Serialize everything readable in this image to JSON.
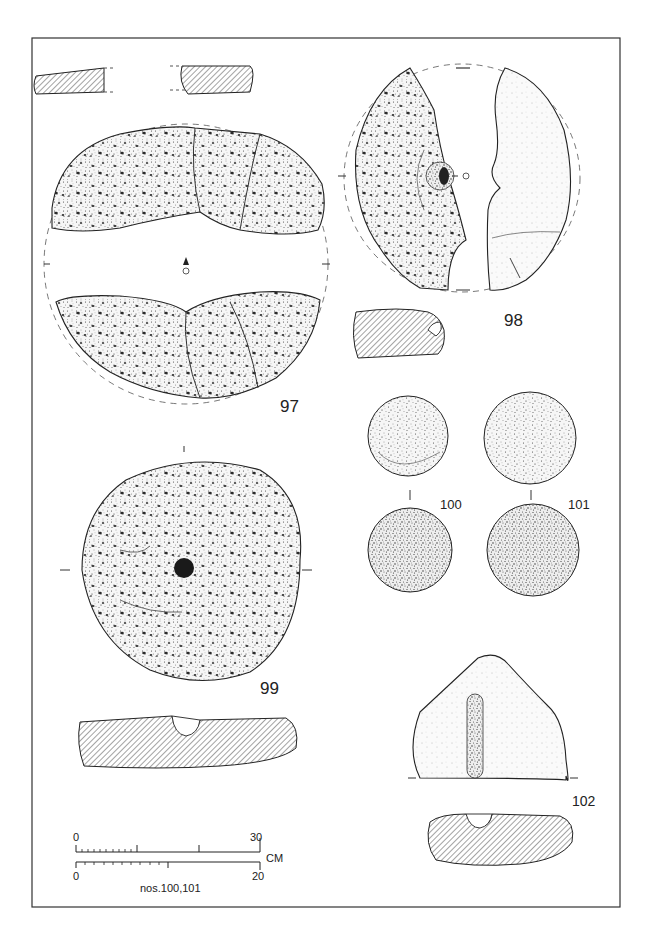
{
  "plate": {
    "frame": {
      "x": 32,
      "y": 38,
      "width": 588,
      "height": 869,
      "color": "#333333"
    },
    "colors": {
      "ink": "#222222",
      "stipple": "#3a3a3a",
      "stone_fill": "#f4f4f4",
      "hatch": "#333333",
      "paper": "#ffffff"
    }
  },
  "objects": [
    {
      "id": "97",
      "label": "97",
      "type": "quern-stone fragments (upper and lower views, with sections)"
    },
    {
      "id": "98",
      "label": "98",
      "type": "perforated quern halves with section"
    },
    {
      "id": "99",
      "label": "99",
      "type": "perforated disc quern with section"
    },
    {
      "id": "100",
      "label": "100",
      "type": "stone ball (two views)"
    },
    {
      "id": "101",
      "label": "101",
      "type": "stone ball (two views)"
    },
    {
      "id": "102",
      "label": "102",
      "type": "grooved stone with section"
    }
  ],
  "scale_bar": {
    "upper": {
      "start": "0",
      "end": "30",
      "unit": "CM"
    },
    "lower": {
      "start": "0",
      "end": "20",
      "caption": "nos.100,101"
    }
  }
}
